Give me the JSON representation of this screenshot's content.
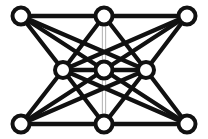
{
  "figure": {
    "background_color": "#ffffff",
    "edge_color": "#111111",
    "faint_edge_color": "#b9b9b9",
    "node_fill_color": "#ffffff",
    "node_stroke_color": "#111111",
    "width": 208,
    "height": 139
  },
  "chart_data": {
    "type": "diagram",
    "subtype": "node-link-graph",
    "title": "",
    "node_count": 9,
    "edge_count": 20,
    "nodes": [
      {
        "id": "tl",
        "label": "",
        "x": 21,
        "y": 16,
        "r": 8.5
      },
      {
        "id": "tm",
        "label": "",
        "x": 104,
        "y": 16,
        "r": 8.5
      },
      {
        "id": "tr",
        "label": "",
        "x": 187,
        "y": 16,
        "r": 8.5
      },
      {
        "id": "ml",
        "label": "",
        "x": 63,
        "y": 70,
        "r": 8.0
      },
      {
        "id": "c",
        "label": "",
        "x": 104,
        "y": 70,
        "r": 8.5
      },
      {
        "id": "mr",
        "label": "",
        "x": 146,
        "y": 70,
        "r": 8.0
      },
      {
        "id": "bl",
        "label": "",
        "x": 21,
        "y": 124,
        "r": 8.5
      },
      {
        "id": "bm",
        "label": "",
        "x": 104,
        "y": 124,
        "r": 8.5
      },
      {
        "id": "br",
        "label": "",
        "x": 187,
        "y": 124,
        "r": 8.5
      }
    ],
    "edges": [
      {
        "from": "tl",
        "to": "tm",
        "style": "solid"
      },
      {
        "from": "tm",
        "to": "tr",
        "style": "solid"
      },
      {
        "from": "bl",
        "to": "bm",
        "style": "solid"
      },
      {
        "from": "bm",
        "to": "br",
        "style": "solid"
      },
      {
        "from": "ml",
        "to": "c",
        "style": "solid"
      },
      {
        "from": "c",
        "to": "mr",
        "style": "solid"
      },
      {
        "from": "tl",
        "to": "ml",
        "style": "solid"
      },
      {
        "from": "tl",
        "to": "c",
        "style": "solid"
      },
      {
        "from": "tl",
        "to": "mr",
        "style": "solid"
      },
      {
        "from": "tr",
        "to": "mr",
        "style": "solid"
      },
      {
        "from": "tr",
        "to": "c",
        "style": "solid"
      },
      {
        "from": "tr",
        "to": "ml",
        "style": "solid"
      },
      {
        "from": "bl",
        "to": "ml",
        "style": "solid"
      },
      {
        "from": "bl",
        "to": "c",
        "style": "solid"
      },
      {
        "from": "bl",
        "to": "mr",
        "style": "solid"
      },
      {
        "from": "br",
        "to": "mr",
        "style": "solid"
      },
      {
        "from": "br",
        "to": "c",
        "style": "solid"
      },
      {
        "from": "br",
        "to": "ml",
        "style": "solid"
      },
      {
        "from": "tm",
        "to": "ml",
        "style": "solid"
      },
      {
        "from": "tm",
        "to": "mr",
        "style": "solid"
      },
      {
        "from": "bm",
        "to": "ml",
        "style": "solid"
      },
      {
        "from": "bm",
        "to": "mr",
        "style": "solid"
      },
      {
        "from": "tm",
        "to": "c",
        "style": "faint-double"
      },
      {
        "from": "c",
        "to": "bm",
        "style": "faint-double"
      }
    ],
    "legend": [],
    "annotations": []
  }
}
